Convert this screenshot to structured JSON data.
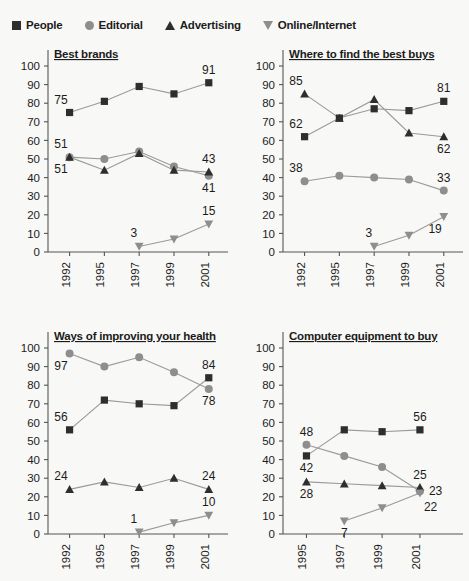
{
  "legend": {
    "items": [
      {
        "label": "People",
        "icon": "square-marker-icon",
        "shape": "square",
        "color": "#2e2e2e"
      },
      {
        "label": "Editorial",
        "icon": "circle-marker-icon",
        "shape": "circle",
        "color": "#8e8e8e"
      },
      {
        "label": "Advertising",
        "icon": "triangle-up-marker-icon",
        "shape": "triangle-up",
        "color": "#2e2e2e"
      },
      {
        "label": "Online/Internet",
        "icon": "triangle-down-marker-icon",
        "shape": "triangle-down",
        "color": "#8e8e8e"
      }
    ]
  },
  "style": {
    "background": "#f8f8f6",
    "dark": "#2e2e2e",
    "gray": "#8e8e8e",
    "axis": "#555555",
    "text": "#1c1c1c"
  },
  "chart_data": [
    {
      "type": "line",
      "title": "Best brands",
      "xlabel": "",
      "ylabel": "",
      "ylim": [
        0,
        100
      ],
      "yticks": [
        0,
        10,
        20,
        30,
        40,
        50,
        60,
        70,
        80,
        90,
        100
      ],
      "grid": false,
      "legend_position": "top-shared",
      "categories": [
        "1992",
        "1995",
        "1997",
        "1999",
        "2001"
      ],
      "series": [
        {
          "name": "People",
          "shape": "square",
          "color": "#2e2e2e",
          "values": [
            75,
            81,
            89,
            85,
            91
          ],
          "labels": [
            {
              "x": "1992",
              "value": 75,
              "pos": "above-left"
            },
            {
              "x": "2001",
              "value": 91,
              "pos": "above"
            }
          ]
        },
        {
          "name": "Editorial",
          "shape": "circle",
          "color": "#8e8e8e",
          "values": [
            51,
            50,
            54,
            46,
            41
          ],
          "labels": [
            {
              "x": "1992",
              "value": 51,
              "pos": "above-left"
            },
            {
              "x": "2001",
              "value": 41,
              "pos": "below"
            }
          ]
        },
        {
          "name": "Advertising",
          "shape": "triangle-up",
          "color": "#2e2e2e",
          "values": [
            51,
            44,
            53,
            44,
            43
          ],
          "labels": [
            {
              "x": "1992",
              "value": 51,
              "pos": "below-left"
            },
            {
              "x": "2001",
              "value": 43,
              "pos": "above"
            }
          ]
        },
        {
          "name": "Online/Internet",
          "shape": "triangle-down",
          "color": "#8e8e8e",
          "values": [
            null,
            null,
            3,
            7,
            15
          ],
          "labels": [
            {
              "x": "1997",
              "value": 3,
              "pos": "above-left"
            },
            {
              "x": "2001",
              "value": 15,
              "pos": "above"
            }
          ]
        }
      ]
    },
    {
      "type": "line",
      "title": "Where to find the best buys",
      "xlabel": "",
      "ylabel": "",
      "ylim": [
        0,
        100
      ],
      "yticks": [
        0,
        10,
        20,
        30,
        40,
        50,
        60,
        70,
        80,
        90,
        100
      ],
      "grid": false,
      "legend_position": "top-shared",
      "categories": [
        "1992",
        "1995",
        "1997",
        "1999",
        "2001"
      ],
      "series": [
        {
          "name": "People",
          "shape": "square",
          "color": "#2e2e2e",
          "values": [
            62,
            72,
            77,
            76,
            81
          ],
          "labels": [
            {
              "x": "1992",
              "value": 62,
              "pos": "above-left"
            },
            {
              "x": "2001",
              "value": 81,
              "pos": "above"
            }
          ]
        },
        {
          "name": "Editorial",
          "shape": "circle",
          "color": "#8e8e8e",
          "values": [
            38,
            41,
            40,
            39,
            33
          ],
          "labels": [
            {
              "x": "1992",
              "value": 38,
              "pos": "above-left"
            },
            {
              "x": "2001",
              "value": 33,
              "pos": "above"
            }
          ]
        },
        {
          "name": "Advertising",
          "shape": "triangle-up",
          "color": "#2e2e2e",
          "values": [
            85,
            72,
            82,
            64,
            62
          ],
          "labels": [
            {
              "x": "1992",
              "value": 85,
              "pos": "above-left"
            },
            {
              "x": "2001",
              "value": 62,
              "pos": "below"
            }
          ]
        },
        {
          "name": "Online/Internet",
          "shape": "triangle-down",
          "color": "#8e8e8e",
          "values": [
            null,
            null,
            3,
            9,
            19
          ],
          "labels": [
            {
              "x": "1997",
              "value": 3,
              "pos": "above-left"
            },
            {
              "x": "2001",
              "value": 19,
              "pos": "below-left"
            }
          ]
        }
      ]
    },
    {
      "type": "line",
      "title": "Ways of improving your health",
      "xlabel": "",
      "ylabel": "",
      "ylim": [
        0,
        100
      ],
      "yticks": [
        0,
        10,
        20,
        30,
        40,
        50,
        60,
        70,
        80,
        90,
        100
      ],
      "grid": false,
      "legend_position": "top-shared",
      "categories": [
        "1992",
        "1995",
        "1997",
        "1999",
        "2001"
      ],
      "series": [
        {
          "name": "People",
          "shape": "square",
          "color": "#2e2e2e",
          "values": [
            56,
            72,
            70,
            69,
            84
          ],
          "labels": [
            {
              "x": "1992",
              "value": 56,
              "pos": "above-left"
            },
            {
              "x": "2001",
              "value": 84,
              "pos": "above"
            }
          ]
        },
        {
          "name": "Editorial",
          "shape": "circle",
          "color": "#8e8e8e",
          "values": [
            97,
            90,
            95,
            87,
            78
          ],
          "labels": [
            {
              "x": "1992",
              "value": 97,
              "pos": "below-left"
            },
            {
              "x": "2001",
              "value": 78,
              "pos": "below"
            }
          ]
        },
        {
          "name": "Advertising",
          "shape": "triangle-up",
          "color": "#2e2e2e",
          "values": [
            24,
            28,
            25,
            30,
            24
          ],
          "labels": [
            {
              "x": "1992",
              "value": 24,
              "pos": "above-left"
            },
            {
              "x": "2001",
              "value": 24,
              "pos": "above"
            }
          ]
        },
        {
          "name": "Online/Internet",
          "shape": "triangle-down",
          "color": "#8e8e8e",
          "values": [
            null,
            null,
            1,
            6,
            10
          ],
          "labels": [
            {
              "x": "1997",
              "value": 1,
              "pos": "above-left"
            },
            {
              "x": "2001",
              "value": 10,
              "pos": "above"
            }
          ]
        }
      ]
    },
    {
      "type": "line",
      "title": "Computer equipment to buy",
      "xlabel": "",
      "ylabel": "",
      "ylim": [
        0,
        100
      ],
      "yticks": [
        0,
        10,
        20,
        30,
        40,
        50,
        60,
        70,
        80,
        90,
        100
      ],
      "grid": false,
      "legend_position": "top-shared",
      "categories": [
        "1995",
        "1997",
        "1999",
        "2001"
      ],
      "series": [
        {
          "name": "People",
          "shape": "square",
          "color": "#2e2e2e",
          "values": [
            42,
            56,
            55,
            56
          ],
          "labels": [
            {
              "x": "1995",
              "value": 42,
              "pos": "below"
            },
            {
              "x": "2001",
              "value": 56,
              "pos": "above"
            }
          ]
        },
        {
          "name": "Editorial",
          "shape": "circle",
          "color": "#8e8e8e",
          "values": [
            48,
            42,
            36,
            23
          ],
          "labels": [
            {
              "x": "1995",
              "value": 48,
              "pos": "above"
            },
            {
              "x": "2001",
              "value": 23,
              "pos": "right"
            }
          ]
        },
        {
          "name": "Advertising",
          "shape": "triangle-up",
          "color": "#2e2e2e",
          "values": [
            28,
            27,
            26,
            25
          ],
          "labels": [
            {
              "x": "1995",
              "value": 28,
              "pos": "below"
            },
            {
              "x": "2001",
              "value": 25,
              "pos": "above"
            }
          ]
        },
        {
          "name": "Online/Internet",
          "shape": "triangle-down",
          "color": "#8e8e8e",
          "values": [
            null,
            7,
            14,
            22
          ],
          "labels": [
            {
              "x": "1997",
              "value": 7,
              "pos": "below"
            },
            {
              "x": "2001",
              "value": 22,
              "pos": "below-right"
            }
          ]
        }
      ]
    }
  ]
}
